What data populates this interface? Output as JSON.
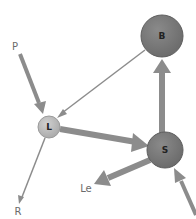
{
  "diagram": {
    "nodes": [
      {
        "id": "B",
        "label": "B",
        "cx": 162,
        "cy": 36,
        "r": 21,
        "fill": "#7a7a7a"
      },
      {
        "id": "L",
        "label": "L",
        "cx": 49,
        "cy": 127,
        "r": 11,
        "fill": "#b8b8b8"
      },
      {
        "id": "S",
        "label": "S",
        "cx": 165,
        "cy": 150,
        "r": 18,
        "fill": "#7a7a7a"
      }
    ],
    "labels": {
      "P": "P",
      "R": "R",
      "Le": "Le"
    },
    "edges": [
      {
        "from": "P",
        "to": "L",
        "weight": "medium"
      },
      {
        "from": "B",
        "to": "L",
        "weight": "thin"
      },
      {
        "from": "L",
        "to": "S",
        "weight": "thick"
      },
      {
        "from": "S",
        "to": "B",
        "weight": "thick"
      },
      {
        "from": "S",
        "to": "Le",
        "weight": "thick"
      },
      {
        "from": "L",
        "to": "R",
        "weight": "thin"
      },
      {
        "from": "offscreen",
        "to": "S",
        "weight": "medium"
      }
    ],
    "colors": {
      "arrow": "#8c8c8c",
      "text": "#6b6b6b"
    }
  }
}
